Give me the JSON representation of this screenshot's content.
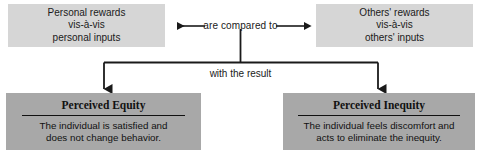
{
  "diagram": {
    "colors": {
      "top_box_fill": "#d6d6d6",
      "bottom_box_fill": "#a8a8a8",
      "line": "#1a1a1a",
      "text": "#111111",
      "background": "#ffffff"
    },
    "top_left_box": {
      "lines": [
        "Personal rewards",
        "vis-à-vis",
        "personal inputs"
      ]
    },
    "top_right_box": {
      "lines": [
        "Others' rewards",
        "vis-à-vis",
        "others' inputs"
      ]
    },
    "compare_label": "are compared to",
    "result_label": "with the result",
    "bottom_left_box": {
      "heading": "Perceived Equity",
      "body_lines": [
        "The individual is satisfied and",
        "does not change behavior."
      ]
    },
    "bottom_right_box": {
      "heading": "Perceived Inequity",
      "body_lines": [
        "The individual feels discomfort and",
        "acts to eliminate the inequity."
      ]
    },
    "connectors": [
      {
        "name": "arrow-left-to-personal-box",
        "direction": "left"
      },
      {
        "name": "arrow-right-to-others-box",
        "direction": "right"
      },
      {
        "name": "arrow-down-to-equity-box",
        "direction": "down"
      },
      {
        "name": "arrow-down-to-inequity-box",
        "direction": "down"
      }
    ]
  }
}
